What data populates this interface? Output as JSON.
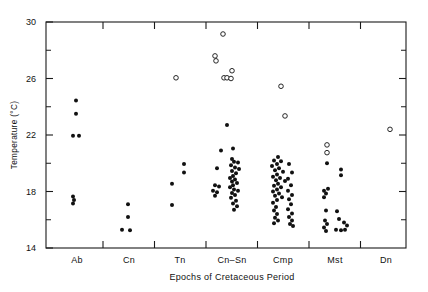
{
  "chart_data": {
    "type": "scatter",
    "title": "",
    "xlabel": "Epochs of Cretaceous Period",
    "ylabel": "Temperature (°C)",
    "ylim": [
      14,
      30
    ],
    "ytick_labels": [
      "30",
      "26",
      "22",
      "18",
      "14"
    ],
    "ytick_values": [
      30,
      26,
      22,
      18,
      14
    ],
    "yminor_values": [
      28,
      24,
      20,
      16
    ],
    "grid": false,
    "legend": null,
    "categories": [
      "Ab",
      "Cn",
      "Tn",
      "Cn–Sn",
      "Cmp",
      "Mst",
      "Dn"
    ],
    "category_centers": [
      77,
      129,
      180,
      232,
      283,
      335,
      386
    ],
    "marker_styles": {
      "filled": "solid-circle",
      "open": "open-circle"
    },
    "series": [
      {
        "name": "filled",
        "marker": "filled",
        "points": [
          {
            "cat": "Ab",
            "dx": -1,
            "y": 24.45
          },
          {
            "cat": "Ab",
            "dx": -1,
            "y": 23.5
          },
          {
            "cat": "Ab",
            "dx": -4,
            "y": 21.95
          },
          {
            "cat": "Ab",
            "dx": 2,
            "y": 21.95
          },
          {
            "cat": "Ab",
            "dx": -4,
            "y": 17.65
          },
          {
            "cat": "Ab",
            "dx": -3,
            "y": 17.4
          },
          {
            "cat": "Ab",
            "dx": -4,
            "y": 17.15
          },
          {
            "cat": "Cn",
            "dx": -1,
            "y": 17.1
          },
          {
            "cat": "Cn",
            "dx": -1,
            "y": 16.2
          },
          {
            "cat": "Cn",
            "dx": -7,
            "y": 15.3
          },
          {
            "cat": "Cn",
            "dx": 1,
            "y": 15.25
          },
          {
            "cat": "Tn",
            "dx": 4,
            "y": 19.95
          },
          {
            "cat": "Tn",
            "dx": 4,
            "y": 19.35
          },
          {
            "cat": "Tn",
            "dx": -8,
            "y": 18.55
          },
          {
            "cat": "Tn",
            "dx": -8,
            "y": 17.05
          },
          {
            "cat": "Cn–Sn",
            "dx": -5,
            "y": 22.7
          },
          {
            "cat": "Cn–Sn",
            "dx": -11,
            "y": 20.9
          },
          {
            "cat": "Cn–Sn",
            "dx": -15,
            "y": 19.65
          },
          {
            "cat": "Cn–Sn",
            "dx": -17,
            "y": 18.45
          },
          {
            "cat": "Cn–Sn",
            "dx": -13,
            "y": 18.35
          },
          {
            "cat": "Cn–Sn",
            "dx": -19,
            "y": 18.05
          },
          {
            "cat": "Cn–Sn",
            "dx": -15,
            "y": 17.95
          },
          {
            "cat": "Cn–Sn",
            "dx": -17,
            "y": 17.7
          },
          {
            "cat": "Cn–Sn",
            "dx": 1,
            "y": 21.05
          },
          {
            "cat": "Cn–Sn",
            "dx": 0,
            "y": 20.3
          },
          {
            "cat": "Cn–Sn",
            "dx": 2,
            "y": 20.1
          },
          {
            "cat": "Cn–Sn",
            "dx": 6,
            "y": 20.05
          },
          {
            "cat": "Cn–Sn",
            "dx": -1,
            "y": 19.85
          },
          {
            "cat": "Cn–Sn",
            "dx": 3,
            "y": 19.7
          },
          {
            "cat": "Cn–Sn",
            "dx": 7,
            "y": 19.6
          },
          {
            "cat": "Cn–Sn",
            "dx": 0,
            "y": 19.45
          },
          {
            "cat": "Cn–Sn",
            "dx": 4,
            "y": 19.3
          },
          {
            "cat": "Cn–Sn",
            "dx": 1,
            "y": 19.1
          },
          {
            "cat": "Cn–Sn",
            "dx": -2,
            "y": 18.95
          },
          {
            "cat": "Cn–Sn",
            "dx": 3,
            "y": 18.85
          },
          {
            "cat": "Cn–Sn",
            "dx": 0,
            "y": 18.7
          },
          {
            "cat": "Cn–Sn",
            "dx": 5,
            "y": 18.6
          },
          {
            "cat": "Cn–Sn",
            "dx": 1,
            "y": 18.45
          },
          {
            "cat": "Cn–Sn",
            "dx": -2,
            "y": 18.3
          },
          {
            "cat": "Cn–Sn",
            "dx": 2,
            "y": 18.15
          },
          {
            "cat": "Cn–Sn",
            "dx": 6,
            "y": 18.05
          },
          {
            "cat": "Cn–Sn",
            "dx": 0,
            "y": 17.9
          },
          {
            "cat": "Cn–Sn",
            "dx": 3,
            "y": 17.75
          },
          {
            "cat": "Cn–Sn",
            "dx": -1,
            "y": 17.55
          },
          {
            "cat": "Cn–Sn",
            "dx": 4,
            "y": 17.35
          },
          {
            "cat": "Cn–Sn",
            "dx": 1,
            "y": 17.15
          },
          {
            "cat": "Cn–Sn",
            "dx": 5,
            "y": 16.95
          },
          {
            "cat": "Cn–Sn",
            "dx": 2,
            "y": 16.7
          },
          {
            "cat": "Cmp",
            "dx": -5,
            "y": 20.45
          },
          {
            "cat": "Cmp",
            "dx": -9,
            "y": 20.2
          },
          {
            "cat": "Cmp",
            "dx": -2,
            "y": 20.15
          },
          {
            "cat": "Cmp",
            "dx": -6,
            "y": 19.95
          },
          {
            "cat": "Cmp",
            "dx": -11,
            "y": 19.8
          },
          {
            "cat": "Cmp",
            "dx": -4,
            "y": 19.65
          },
          {
            "cat": "Cmp",
            "dx": -8,
            "y": 19.5
          },
          {
            "cat": "Cmp",
            "dx": 0,
            "y": 19.4
          },
          {
            "cat": "Cmp",
            "dx": -6,
            "y": 19.2
          },
          {
            "cat": "Cmp",
            "dx": -10,
            "y": 19.05
          },
          {
            "cat": "Cmp",
            "dx": -3,
            "y": 18.95
          },
          {
            "cat": "Cmp",
            "dx": -7,
            "y": 18.8
          },
          {
            "cat": "Cmp",
            "dx": 2,
            "y": 18.75
          },
          {
            "cat": "Cmp",
            "dx": -5,
            "y": 18.55
          },
          {
            "cat": "Cmp",
            "dx": -9,
            "y": 18.4
          },
          {
            "cat": "Cmp",
            "dx": -2,
            "y": 18.3
          },
          {
            "cat": "Cmp",
            "dx": -6,
            "y": 18.15
          },
          {
            "cat": "Cmp",
            "dx": -10,
            "y": 18.0
          },
          {
            "cat": "Cmp",
            "dx": -4,
            "y": 17.85
          },
          {
            "cat": "Cmp",
            "dx": -8,
            "y": 17.7
          },
          {
            "cat": "Cmp",
            "dx": -1,
            "y": 17.6
          },
          {
            "cat": "Cmp",
            "dx": -6,
            "y": 17.4
          },
          {
            "cat": "Cmp",
            "dx": -10,
            "y": 17.2
          },
          {
            "cat": "Cmp",
            "dx": -7,
            "y": 16.9
          },
          {
            "cat": "Cmp",
            "dx": -9,
            "y": 16.65
          },
          {
            "cat": "Cmp",
            "dx": -6,
            "y": 16.4
          },
          {
            "cat": "Cmp",
            "dx": -8,
            "y": 16.15
          },
          {
            "cat": "Cmp",
            "dx": -5,
            "y": 15.95
          },
          {
            "cat": "Cmp",
            "dx": -9,
            "y": 15.75
          },
          {
            "cat": "Cmp",
            "dx": 6,
            "y": 19.95
          },
          {
            "cat": "Cmp",
            "dx": 9,
            "y": 19.35
          },
          {
            "cat": "Cmp",
            "dx": 5,
            "y": 18.9
          },
          {
            "cat": "Cmp",
            "dx": 8,
            "y": 18.45
          },
          {
            "cat": "Cmp",
            "dx": 5,
            "y": 18.05
          },
          {
            "cat": "Cmp",
            "dx": 9,
            "y": 17.75
          },
          {
            "cat": "Cmp",
            "dx": 6,
            "y": 17.45
          },
          {
            "cat": "Cmp",
            "dx": 8,
            "y": 17.1
          },
          {
            "cat": "Cmp",
            "dx": 5,
            "y": 16.75
          },
          {
            "cat": "Cmp",
            "dx": 9,
            "y": 16.45
          },
          {
            "cat": "Cmp",
            "dx": 6,
            "y": 16.2
          },
          {
            "cat": "Cmp",
            "dx": 9,
            "y": 15.95
          },
          {
            "cat": "Cmp",
            "dx": 7,
            "y": 15.7
          },
          {
            "cat": "Cmp",
            "dx": 10,
            "y": 15.55
          },
          {
            "cat": "Mst",
            "dx": -8,
            "y": 20.0
          },
          {
            "cat": "Mst",
            "dx": -7,
            "y": 18.2
          },
          {
            "cat": "Mst",
            "dx": -11,
            "y": 18.05
          },
          {
            "cat": "Mst",
            "dx": -9,
            "y": 17.85
          },
          {
            "cat": "Mst",
            "dx": -11,
            "y": 17.6
          },
          {
            "cat": "Mst",
            "dx": -9,
            "y": 16.65
          },
          {
            "cat": "Mst",
            "dx": -10,
            "y": 15.95
          },
          {
            "cat": "Mst",
            "dx": -8,
            "y": 15.7
          },
          {
            "cat": "Mst",
            "dx": -11,
            "y": 15.45
          },
          {
            "cat": "Mst",
            "dx": -9,
            "y": 15.2
          },
          {
            "cat": "Mst",
            "dx": 6,
            "y": 19.55
          },
          {
            "cat": "Mst",
            "dx": 6,
            "y": 19.15
          },
          {
            "cat": "Mst",
            "dx": 2,
            "y": 16.6
          },
          {
            "cat": "Mst",
            "dx": 4,
            "y": 16.05
          },
          {
            "cat": "Mst",
            "dx": 9,
            "y": 15.8
          },
          {
            "cat": "Mst",
            "dx": 12,
            "y": 15.6
          },
          {
            "cat": "Mst",
            "dx": 1,
            "y": 15.3
          },
          {
            "cat": "Mst",
            "dx": 6,
            "y": 15.25
          },
          {
            "cat": "Mst",
            "dx": 10,
            "y": 15.3
          }
        ]
      },
      {
        "name": "open",
        "marker": "open",
        "points": [
          {
            "cat": "Tn",
            "dx": -4,
            "y": 26.05
          },
          {
            "cat": "Cn–Sn",
            "dx": -9,
            "y": 29.15
          },
          {
            "cat": "Cn–Sn",
            "dx": -17,
            "y": 27.6
          },
          {
            "cat": "Cn–Sn",
            "dx": -16,
            "y": 27.25
          },
          {
            "cat": "Cn–Sn",
            "dx": 0,
            "y": 26.55
          },
          {
            "cat": "Cn–Sn",
            "dx": -8,
            "y": 26.05
          },
          {
            "cat": "Cn–Sn",
            "dx": -5,
            "y": 26.05
          },
          {
            "cat": "Cn–Sn",
            "dx": -1,
            "y": 26.0
          },
          {
            "cat": "Cmp",
            "dx": -2,
            "y": 25.45
          },
          {
            "cat": "Cmp",
            "dx": 2,
            "y": 23.35
          },
          {
            "cat": "Mst",
            "dx": -8,
            "y": 21.3
          },
          {
            "cat": "Mst",
            "dx": -8,
            "y": 20.75
          },
          {
            "cat": "Dn",
            "dx": 4,
            "y": 22.4
          }
        ]
      }
    ]
  }
}
